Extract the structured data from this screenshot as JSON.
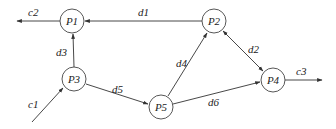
{
  "diagram": {
    "type": "directed-graph",
    "nodes": [
      {
        "id": "P1",
        "label": "P1",
        "x": 72,
        "y": 21
      },
      {
        "id": "P2",
        "label": "P2",
        "x": 214,
        "y": 21
      },
      {
        "id": "P3",
        "label": "P3",
        "x": 74,
        "y": 79
      },
      {
        "id": "P5",
        "label": "P5",
        "x": 161,
        "y": 107
      },
      {
        "id": "P4",
        "label": "P4",
        "x": 273,
        "y": 80
      }
    ],
    "edges": [
      {
        "id": "c1",
        "label": "c1",
        "from": "external",
        "to": "P3"
      },
      {
        "id": "c2",
        "label": "c2",
        "from": "P1",
        "to": "external"
      },
      {
        "id": "c3",
        "label": "c3",
        "from": "P4",
        "to": "external"
      },
      {
        "id": "d1",
        "label": "d1",
        "from": "P2",
        "to": "P1"
      },
      {
        "id": "d2",
        "label": "d2",
        "from": "P2",
        "to": "P4",
        "bidirectional": true
      },
      {
        "id": "d3",
        "label": "d3",
        "from": "P3",
        "to": "P1"
      },
      {
        "id": "d4",
        "label": "d4",
        "from": "P5",
        "to": "P2"
      },
      {
        "id": "d5",
        "label": "d5",
        "from": "P3",
        "to": "P5"
      },
      {
        "id": "d6",
        "label": "d6",
        "from": "P5",
        "to": "P4"
      }
    ]
  },
  "labels": {
    "P1": "P1",
    "P2": "P2",
    "P3": "P3",
    "P4": "P4",
    "P5": "P5",
    "c1": "c1",
    "c2": "c2",
    "c3": "c3",
    "d1": "d1",
    "d2": "d2",
    "d3": "d3",
    "d4": "d4",
    "d5": "d5",
    "d6": "d6"
  },
  "colors": {
    "stroke": "#333333",
    "text": "#222222",
    "background": "#ffffff"
  }
}
